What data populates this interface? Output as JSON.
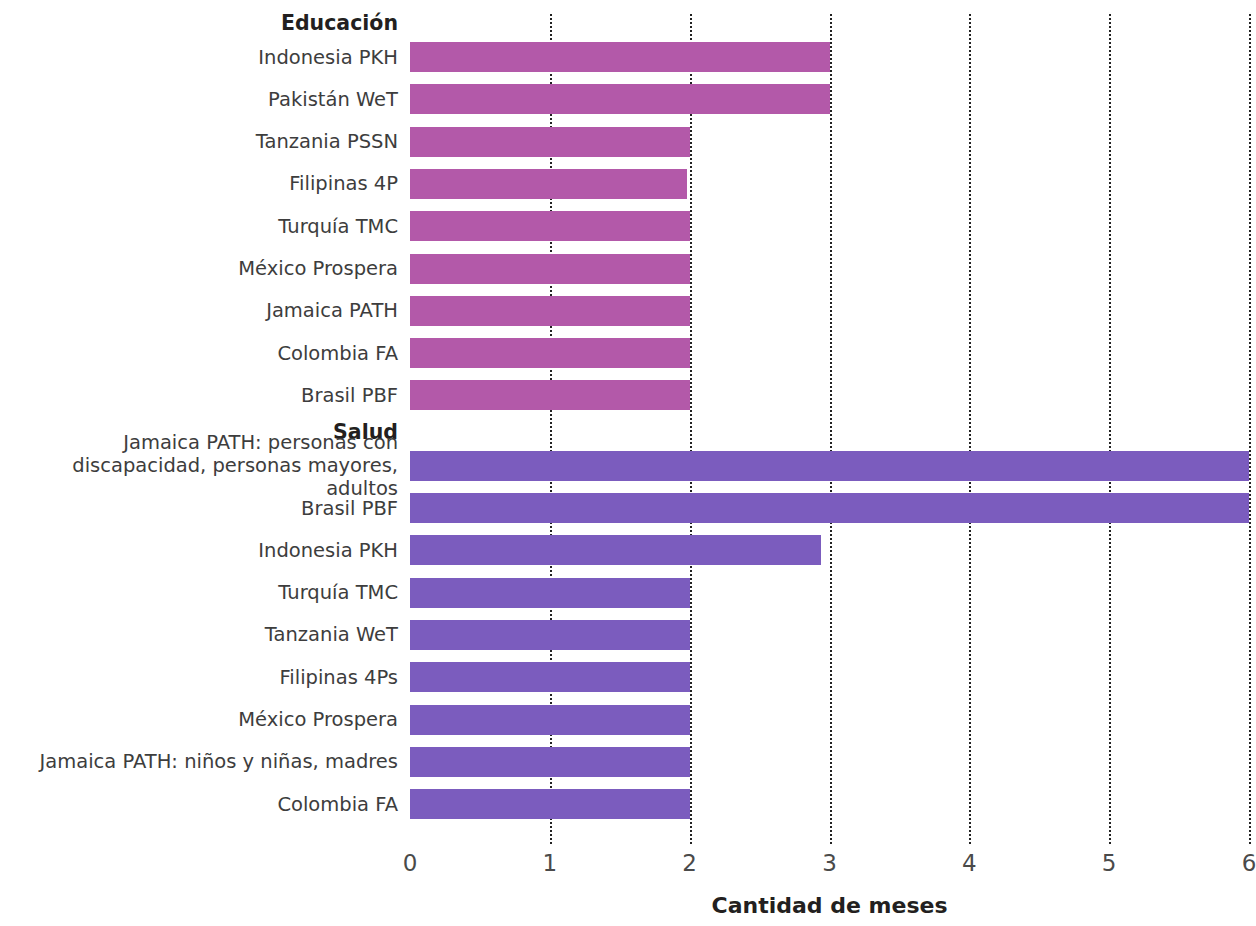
{
  "chart_data": {
    "type": "bar",
    "orientation": "horizontal",
    "title": "",
    "xlabel": "Cantidad de meses",
    "ylabel": "",
    "xlim": [
      0,
      6
    ],
    "xticks": [
      "0",
      "1",
      "2",
      "3",
      "4",
      "5",
      "6"
    ],
    "grid": true,
    "grid_style": "dotted-vertical",
    "legend": "none",
    "groups": [
      {
        "name": "Educación",
        "color": "#b359a9",
        "categories": [
          "Indonesia PKH",
          "Pakistán WeT",
          "Tanzania PSSN",
          "Filipinas 4P",
          "Turquía TMC",
          "México Prospera",
          "Jamaica PATH",
          "Colombia FA",
          "Brasil PBF"
        ],
        "values": [
          3,
          3,
          2,
          1.98,
          2,
          2,
          2,
          2,
          2
        ]
      },
      {
        "name": "Salud",
        "color": "#7b5cbe",
        "categories": [
          "Jamaica PATH: personas con\ndiscapacidad, personas mayores, adultos",
          "Brasil PBF",
          "Indonesia PKH",
          "Turquía TMC",
          "Tanzania WeT",
          "Filipinas 4Ps",
          "México Prospera",
          "Jamaica PATH: niños y niñas, madres",
          "Colombia FA"
        ],
        "values": [
          6,
          6,
          2.94,
          2,
          2,
          2,
          2,
          2,
          2
        ]
      }
    ]
  },
  "colors": {
    "educacion_bar": "#b359a9",
    "salud_bar": "#7b5cbe",
    "gridline": "#222222",
    "label_text": "#3d3d3d",
    "header_text": "#231f20",
    "background": "#ffffff"
  }
}
